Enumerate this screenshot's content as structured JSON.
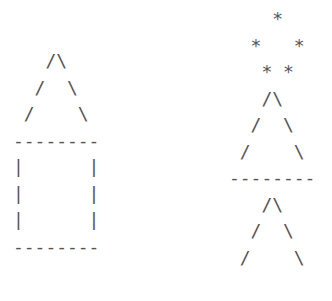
{
  "house": {
    "lines": [
      "   /\\",
      "  /  \\",
      " /    \\",
      "--------",
      "|      |",
      "|      |",
      "|      |",
      "--------"
    ]
  },
  "tree": {
    "lines": [
      "    *",
      "  *   *",
      "   * *",
      "   /\\",
      "  /  \\",
      " /    \\",
      "--------",
      "   /\\",
      "  /  \\",
      " /    \\"
    ]
  }
}
